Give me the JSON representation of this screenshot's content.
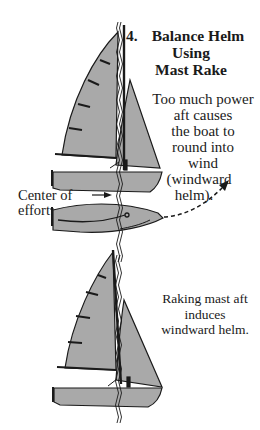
{
  "title": {
    "number": "4.",
    "lines": [
      "Balance Helm",
      "Using",
      "Mast Rake"
    ]
  },
  "top_caption": {
    "lines": [
      "Too much power",
      "aft causes",
      "the boat to",
      "round into",
      "wind",
      "(windward",
      "helm)."
    ]
  },
  "bottom_caption": {
    "lines": [
      "Raking mast aft",
      "induces",
      "windward helm."
    ]
  },
  "label": {
    "lines": [
      "Center of",
      "effort"
    ]
  },
  "colors": {
    "sail_fill": "#a9a9a9",
    "hull_fill": "#a9a9a9",
    "ink": "#1a1a1a",
    "background": "#ffffff"
  },
  "icons": {
    "top_view_arrow": "curved-dashed-arrow",
    "pointer_arrow": "right-arrow"
  }
}
